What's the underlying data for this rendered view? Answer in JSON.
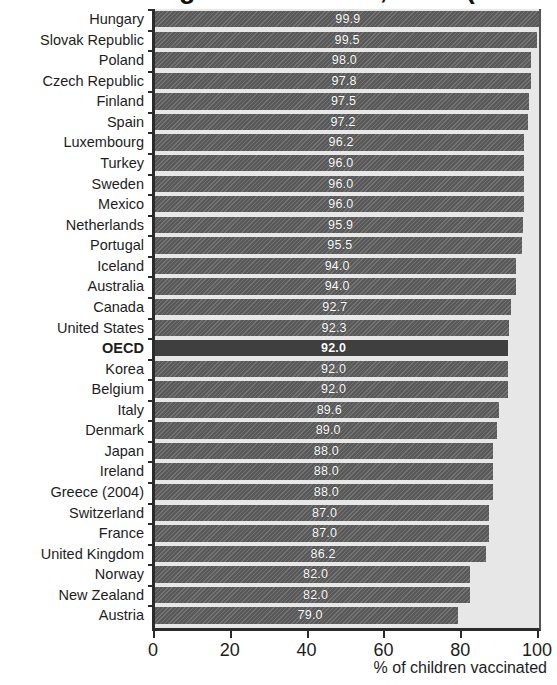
{
  "title_remnant": "Vaccination against measles, 2005 (or latest year available)",
  "chart_data": {
    "type": "bar",
    "orientation": "horizontal",
    "title": "",
    "xlabel": "% of children vaccinated",
    "ylabel": "",
    "xlim": [
      0,
      100
    ],
    "xticks": [
      0,
      20,
      40,
      60,
      80,
      100
    ],
    "xtick_labels": [
      "0",
      "20",
      "40",
      "60",
      "80",
      "100"
    ],
    "grid": false,
    "legend": null,
    "highlight_category": "OECD",
    "value_label_format": "one decimal, white text inside bar",
    "categories": [
      "Hungary",
      "Slovak Republic",
      "Poland",
      "Czech Republic",
      "Finland",
      "Spain",
      "Luxembourg",
      "Turkey",
      "Sweden",
      "Mexico",
      "Netherlands",
      "Portugal",
      "Iceland",
      "Australia",
      "Canada",
      "United States",
      "OECD",
      "Korea",
      "Belgium",
      "Italy",
      "Denmark",
      "Japan",
      "Ireland",
      "Greece (2004)",
      "Switzerland",
      "France",
      "United Kingdom",
      "Norway",
      "New Zealand",
      "Austria"
    ],
    "values": [
      99.9,
      99.5,
      98.0,
      97.8,
      97.5,
      97.2,
      96.2,
      96.0,
      96.0,
      96.0,
      95.9,
      95.5,
      94.0,
      94.0,
      92.7,
      92.3,
      92.0,
      92.0,
      92.0,
      89.6,
      89.0,
      88.0,
      88.0,
      88.0,
      87.0,
      87.0,
      86.2,
      82.0,
      82.0,
      79.0
    ],
    "value_labels": [
      "99.9",
      "99.5",
      "98.0",
      "97.8",
      "97.5",
      "97.2",
      "96.2",
      "96.0",
      "96.0",
      "96.0",
      "95.9",
      "95.5",
      "94.0",
      "94.0",
      "92.7",
      "92.3",
      "92.0",
      "92.0",
      "92.0",
      "89.6",
      "89.0",
      "88.0",
      "88.0",
      "88.0",
      "87.0",
      "87.0",
      "86.2",
      "82.0",
      "82.0",
      "79.0"
    ]
  },
  "colors": {
    "bar": "#595959",
    "bar_highlight": "#3f3f3f",
    "plot_background": "#e7e7e7",
    "axis": "#2b2b2b",
    "value_text": "#ffffff",
    "label_text": "#1d1d1d",
    "page_background": "#ffffff"
  }
}
